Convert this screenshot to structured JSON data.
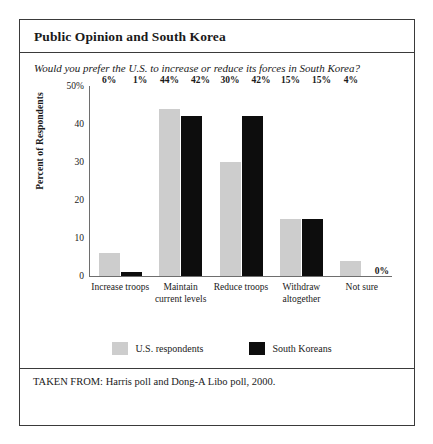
{
  "chart_data": {
    "type": "bar",
    "title": "Public Opinion and South Korea",
    "subtitle": "Would you prefer the U.S. to increase or reduce its forces in South Korea?",
    "xlabel": "",
    "ylabel": "Percent of Respondents",
    "ylim": [
      0,
      50
    ],
    "yticks": [
      {
        "value": 50,
        "label": "50%"
      },
      {
        "value": 40,
        "label": "40"
      },
      {
        "value": 30,
        "label": "30"
      },
      {
        "value": 20,
        "label": "20"
      },
      {
        "value": 10,
        "label": "10"
      },
      {
        "value": 0,
        "label": "0"
      }
    ],
    "grid": false,
    "legend_position": "bottom",
    "categories": [
      "Increase troops",
      "Maintain current levels",
      "Reduce troops",
      "Withdraw altogether",
      "Not sure"
    ],
    "series": [
      {
        "name": "U.S. respondents",
        "color": "#cdcdcd",
        "values": [
          6,
          44,
          30,
          15,
          4
        ],
        "labels": [
          "6%",
          "44%",
          "30%",
          "15%",
          "4%"
        ]
      },
      {
        "name": "South Koreans",
        "color": "#0d0d0d",
        "values": [
          1,
          42,
          42,
          15,
          0
        ],
        "labels": [
          "1%",
          "42%",
          "42%",
          "15%",
          "0%"
        ]
      }
    ],
    "source": "TAKEN FROM: Harris poll and Dong-A Libo poll, 2000."
  }
}
